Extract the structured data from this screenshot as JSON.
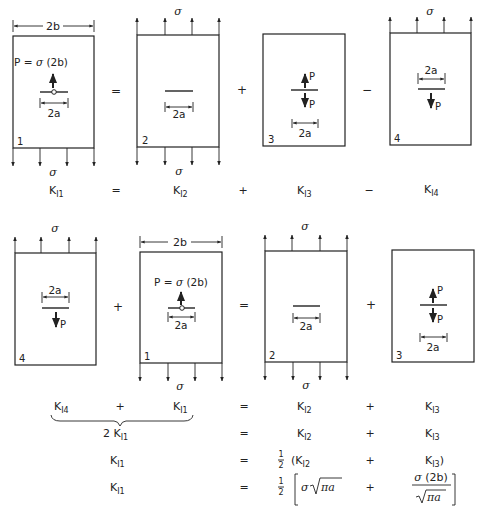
{
  "figure": {
    "symbols": {
      "sigma": "σ",
      "width": "2b",
      "crack_length": "2a",
      "point_load": "P",
      "point_load_def": "P = σ (2b)"
    },
    "row1": {
      "panels": [
        {
          "id": "1",
          "label": "1",
          "loading": "point load P = σ(2b) on crack, σ on bottom edge"
        },
        {
          "id": "2",
          "label": "2",
          "loading": "uniform σ on both edges"
        },
        {
          "id": "3",
          "label": "3",
          "loading": "wedge forces P on crack faces"
        },
        {
          "id": "4",
          "label": "4",
          "loading": "σ on top edge, P on lower crack face"
        }
      ],
      "operators": [
        "=",
        "+",
        "−"
      ],
      "equation": {
        "terms": [
          {
            "base": "K",
            "sub": "I1"
          },
          {
            "op": "="
          },
          {
            "base": "K",
            "sub": "I2"
          },
          {
            "op": "+"
          },
          {
            "base": "K",
            "sub": "I3"
          },
          {
            "op": "−"
          },
          {
            "base": "K",
            "sub": "I4"
          }
        ]
      }
    },
    "row2": {
      "panels": [
        {
          "id": "4",
          "label": "4"
        },
        {
          "id": "1",
          "label": "1"
        },
        {
          "id": "2",
          "label": "2"
        },
        {
          "id": "3",
          "label": "3"
        }
      ],
      "operators": [
        "+",
        "=",
        "+"
      ]
    },
    "equations": [
      {
        "lhs_a": "K",
        "lhs_a_sub": "I4",
        "lhs_op": "+",
        "lhs_b": "K",
        "lhs_b_sub": "I1",
        "eq": "=",
        "r1": "K",
        "r1_sub": "I2",
        "op": "+",
        "r2": "K",
        "r2_sub": "I3"
      },
      {
        "lhs": "2 K",
        "lhs_sub": "I1",
        "eq": "=",
        "r1": "K",
        "r1_sub": "I2",
        "op": "+",
        "r2": "K",
        "r2_sub": "I3"
      },
      {
        "lhs": "K",
        "lhs_sub": "I1",
        "eq": "=",
        "half": "½",
        "r1": "(K",
        "r1_sub": "I2",
        "op": "+",
        "r2": "K",
        "r2_sub": "I3",
        "r2_close": ")"
      },
      {
        "lhs": "K",
        "lhs_sub": "I1",
        "eq": "=",
        "half": "½",
        "r1": "σ √πa",
        "op": "+",
        "r2_num": "σ (2b)",
        "r2_den": "√πa"
      }
    ]
  }
}
